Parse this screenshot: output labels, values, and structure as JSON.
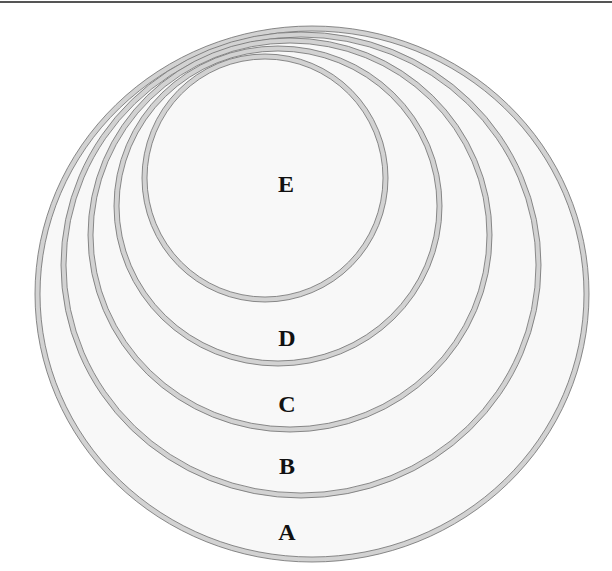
{
  "diagram": {
    "type": "nested-sets",
    "sets": [
      {
        "label": "A",
        "cx": 312,
        "cy": 294,
        "rx": 277,
        "ry": 268,
        "label_x": 287,
        "label_y": 532
      },
      {
        "label": "B",
        "cx": 301,
        "cy": 265,
        "rx": 240,
        "ry": 233,
        "label_x": 287,
        "label_y": 466
      },
      {
        "label": "C",
        "cx": 290,
        "cy": 235,
        "rx": 202,
        "ry": 197,
        "label_x": 287,
        "label_y": 404
      },
      {
        "label": "D",
        "cx": 278,
        "cy": 206,
        "rx": 164,
        "ry": 160,
        "label_x": 287,
        "label_y": 338
      },
      {
        "label": "E",
        "cx": 265,
        "cy": 178,
        "rx": 123,
        "ry": 124,
        "label_x": 286,
        "label_y": 184
      }
    ],
    "colors": {
      "ring": "#d2d2d2",
      "outline": "#6e6e6e",
      "fill": "#f8f8f8"
    }
  },
  "labels": {
    "a": "A",
    "b": "B",
    "c": "C",
    "d": "D",
    "e": "E"
  }
}
